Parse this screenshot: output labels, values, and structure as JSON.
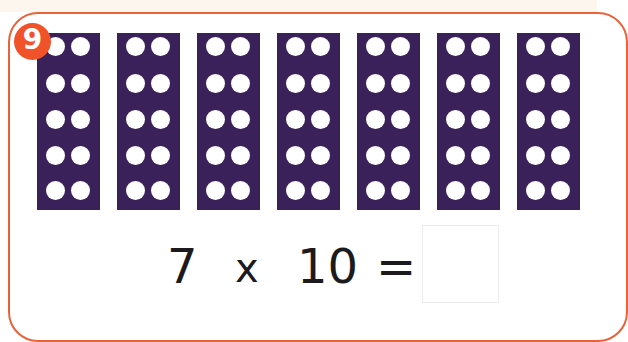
{
  "exercise": {
    "label": "9",
    "colors": {
      "frame_border": "#e8633a",
      "badge": "#f0532a",
      "bar": "#3b2159",
      "dot": "#ffffff",
      "text": "#1c1a1c"
    },
    "bars": {
      "count": 7,
      "rows_per_bar": 5,
      "columns_per_bar": 2,
      "dots_per_bar": 10
    },
    "equation": {
      "left_operand": "7",
      "operator": "x",
      "right_operand": "10",
      "equals": "=",
      "answer": ""
    }
  }
}
